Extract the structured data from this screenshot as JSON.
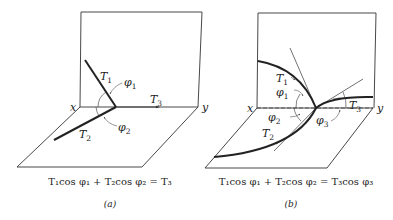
{
  "figure": {
    "panels": [
      {
        "id": "a",
        "caption": "(a)",
        "labels": {
          "x_axis": "x",
          "y_axis": "y",
          "T1": "T",
          "T1_sub": "1",
          "T2": "T",
          "T2_sub": "2",
          "T3": "T",
          "T3_sub": "3",
          "phi1": "φ",
          "phi1_sub": "1",
          "phi2": "φ",
          "phi2_sub": "2"
        },
        "equation": "T₁cos φ₁ + T₂cos φ₂ = T₃"
      },
      {
        "id": "b",
        "caption": "(b)",
        "labels": {
          "x_axis": "x",
          "y_axis": "y",
          "T1": "T",
          "T1_sub": "1",
          "T2": "T",
          "T2_sub": "2",
          "T3": "T",
          "T3_sub": "3",
          "phi1": "φ",
          "phi1_sub": "1",
          "phi2": "φ",
          "phi2_sub": "2",
          "phi3": "φ",
          "phi3_sub": "3"
        },
        "equation": "T₁cos φ₁ + T₂cos φ₂ = T₃cos φ₃"
      }
    ],
    "colors": {
      "line": "#333333",
      "background": "#ffffff"
    }
  }
}
